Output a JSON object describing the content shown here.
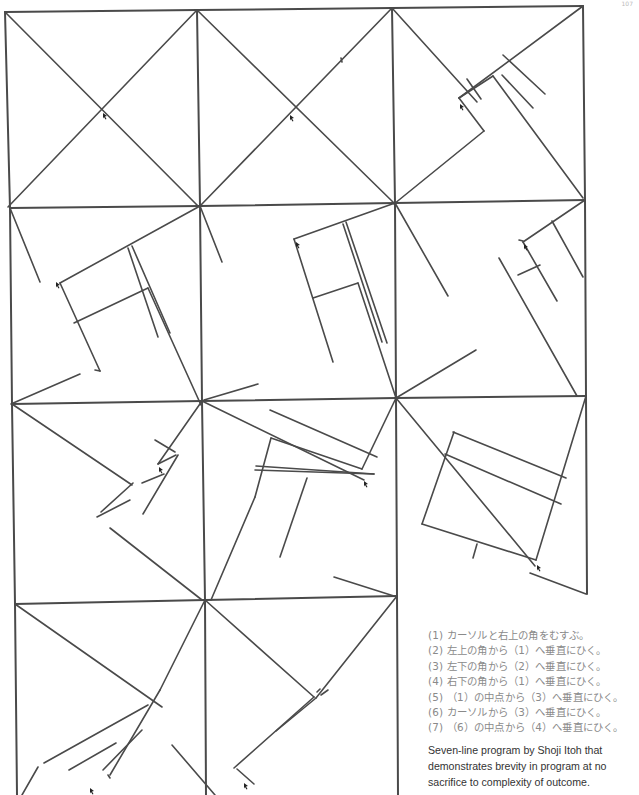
{
  "page_number": "107",
  "caption": {
    "steps": [
      "(1) カーソルと右上の角をむすぶ。",
      "(2) 左上の角から（1）へ垂直にひく。",
      "(3) 左下の角から（2）へ垂直にひく。",
      "(4) 右下の角から（1）へ垂直にひく。",
      "(5) （1）の中点から（3）へ垂直にひく。",
      "(6) カーソルから（3）へ垂直にひく。",
      "(7) （6）の中点から（4）へ垂直にひく。"
    ],
    "description": "Seven-line program by Shoji Itoh that demonstrates brevity in program at no sacrifice to complexity of outcome."
  },
  "figure": {
    "stroke_color": "#4a4a4a",
    "frames": [
      [
        5,
        12,
        197,
        10
      ],
      [
        197,
        10,
        392,
        8
      ],
      [
        392,
        8,
        583,
        6
      ],
      [
        5,
        12,
        10,
        208
      ],
      [
        197,
        10,
        200,
        206
      ],
      [
        392,
        8,
        395,
        203
      ],
      [
        583,
        6,
        585,
        200
      ],
      [
        10,
        208,
        200,
        206
      ],
      [
        200,
        206,
        395,
        203
      ],
      [
        395,
        203,
        585,
        200
      ],
      [
        10,
        208,
        12,
        404
      ],
      [
        200,
        206,
        202,
        401
      ],
      [
        395,
        203,
        396,
        398
      ],
      [
        585,
        200,
        586,
        396
      ],
      [
        12,
        404,
        202,
        401
      ],
      [
        202,
        401,
        396,
        398
      ],
      [
        396,
        398,
        586,
        396
      ],
      [
        12,
        404,
        15,
        604
      ],
      [
        202,
        401,
        205,
        600
      ],
      [
        396,
        398,
        397,
        596
      ],
      [
        586,
        396,
        587,
        594
      ],
      [
        15,
        604,
        205,
        600
      ],
      [
        205,
        600,
        397,
        596
      ],
      [
        15,
        604,
        17,
        795
      ],
      [
        205,
        600,
        206,
        795
      ],
      [
        397,
        596,
        398,
        795
      ]
    ],
    "lines": [
      [
        5,
        12,
        198,
        206
      ],
      [
        197,
        10,
        8,
        207
      ],
      [
        197,
        10,
        394,
        203
      ],
      [
        392,
        8,
        201,
        205
      ],
      [
        341,
        58,
        342,
        62
      ],
      [
        392,
        8,
        477,
        102
      ],
      [
        583,
        6,
        459,
        98
      ],
      [
        459,
        98,
        484,
        131
      ],
      [
        484,
        131,
        394,
        204
      ],
      [
        459,
        98,
        493,
        76
      ],
      [
        467,
        79,
        481,
        99
      ],
      [
        502,
        75,
        533,
        108
      ],
      [
        503,
        55,
        545,
        94
      ],
      [
        493,
        76,
        583,
        198
      ],
      [
        10,
        208,
        40,
        282
      ],
      [
        200,
        206,
        60,
        283
      ],
      [
        60,
        283,
        100,
        371
      ],
      [
        100,
        371,
        95,
        370
      ],
      [
        74,
        323,
        148,
        288
      ],
      [
        128,
        248,
        158,
        337
      ],
      [
        132,
        246,
        170,
        333
      ],
      [
        148,
        288,
        201,
        405
      ],
      [
        11,
        404,
        80,
        374
      ],
      [
        200,
        206,
        222,
        262
      ],
      [
        395,
        203,
        294,
        239
      ],
      [
        294,
        239,
        333,
        362
      ],
      [
        313,
        298,
        358,
        283
      ],
      [
        343,
        224,
        382,
        342
      ],
      [
        346,
        222,
        387,
        343
      ],
      [
        358,
        283,
        396,
        398
      ],
      [
        204,
        400,
        258,
        384
      ],
      [
        395,
        203,
        448,
        296
      ],
      [
        585,
        200,
        523,
        242
      ],
      [
        523,
        242,
        557,
        301
      ],
      [
        518,
        275,
        540,
        265
      ],
      [
        552,
        221,
        583,
        277
      ],
      [
        499,
        258,
        577,
        396
      ],
      [
        519,
        240,
        523,
        241
      ],
      [
        396,
        398,
        476,
        350
      ],
      [
        12,
        404,
        132,
        485
      ],
      [
        202,
        401,
        158,
        464
      ],
      [
        158,
        464,
        176,
        455
      ],
      [
        155,
        440,
        175,
        452
      ],
      [
        178,
        455,
        143,
        514
      ],
      [
        142,
        483,
        164,
        474
      ],
      [
        133,
        483,
        101,
        512
      ],
      [
        97,
        517,
        130,
        500
      ],
      [
        110,
        528,
        202,
        600
      ],
      [
        202,
        401,
        364,
        480
      ],
      [
        396,
        398,
        362,
        469
      ],
      [
        362,
        469,
        271,
        438
      ],
      [
        271,
        438,
        255,
        497
      ],
      [
        270,
        410,
        377,
        457
      ],
      [
        256,
        466,
        374,
        474
      ],
      [
        255,
        470,
        374,
        474
      ],
      [
        307,
        478,
        280,
        557
      ],
      [
        255,
        497,
        211,
        600
      ],
      [
        334,
        577,
        397,
        597
      ],
      [
        396,
        398,
        535,
        566
      ],
      [
        586,
        396,
        536,
        560
      ],
      [
        536,
        560,
        422,
        524
      ],
      [
        422,
        524,
        454,
        432
      ],
      [
        453,
        432,
        566,
        478
      ],
      [
        445,
        454,
        561,
        504
      ],
      [
        477,
        544,
        473,
        558
      ],
      [
        530,
        573,
        586,
        594
      ],
      [
        15,
        604,
        162,
        707
      ],
      [
        205,
        600,
        160,
        690
      ],
      [
        160,
        690,
        110,
        775
      ],
      [
        148,
        705,
        44,
        763
      ],
      [
        142,
        730,
        103,
        770
      ],
      [
        116,
        743,
        69,
        770
      ],
      [
        108,
        775,
        110,
        778
      ],
      [
        38,
        767,
        22,
        795
      ],
      [
        172,
        745,
        215,
        795
      ],
      [
        205,
        600,
        314,
        697
      ],
      [
        397,
        596,
        316,
        698
      ],
      [
        316,
        698,
        276,
        731
      ],
      [
        314,
        697,
        234,
        768
      ],
      [
        237,
        769,
        254,
        784
      ],
      [
        317,
        692,
        320,
        689
      ],
      [
        328,
        690,
        321,
        695
      ]
    ],
    "cursors": [
      [
        103,
        113
      ],
      [
        290,
        115
      ],
      [
        460,
        104
      ],
      [
        56,
        282
      ],
      [
        296,
        242
      ],
      [
        524,
        244
      ],
      [
        159,
        467
      ],
      [
        364,
        481
      ],
      [
        537,
        565
      ],
      [
        90,
        788
      ],
      [
        244,
        783
      ]
    ]
  }
}
